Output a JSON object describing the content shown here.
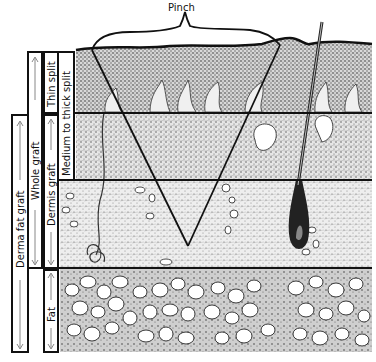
{
  "pinch_label": "Pinch",
  "layers": [
    {
      "name": "epidermis-papillary",
      "label": ""
    },
    {
      "name": "reticular-dermis",
      "label": ""
    },
    {
      "name": "deep-dermis",
      "label": ""
    },
    {
      "name": "subcutaneous-fat",
      "label": ""
    }
  ],
  "brackets": [
    {
      "id": "derma-fat-graft",
      "label": "Derma fat graft",
      "spans": "dermis and fat"
    },
    {
      "id": "whole-graft",
      "label": "Whole graft",
      "spans": "full-thickness skin"
    },
    {
      "id": "thin-split",
      "label": "Thin split",
      "spans": "epidermis and upper dermis"
    },
    {
      "id": "medium-to-thick-split",
      "label": "Medium to thick split",
      "spans": "epidermis to mid dermis"
    },
    {
      "id": "dermis-graft",
      "label": "Dermis graft",
      "spans": "dermis only"
    },
    {
      "id": "fat",
      "label": "Fat",
      "spans": "subcutaneous fat"
    }
  ],
  "colors": {
    "ink": "#111111",
    "paper": "#ffffff",
    "stipple": "#6a6a6a",
    "gray_arrow": "#888888"
  }
}
